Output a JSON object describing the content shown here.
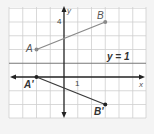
{
  "diagram": {
    "type": "coordinate-reflection",
    "axes": {
      "x_label": "x",
      "y_label": "y",
      "x_tick_label": "1",
      "y_tick_label": "4"
    },
    "line_of_reflection": {
      "label": "y = 1",
      "equation": "y=1"
    },
    "points": {
      "A": {
        "label": "A",
        "x": -2,
        "y": 2
      },
      "B": {
        "label": "B",
        "x": 3,
        "y": 4
      },
      "A_prime": {
        "label": "A'",
        "x": -2,
        "y": 0
      },
      "B_prime": {
        "label": "B'",
        "x": 3,
        "y": -2
      }
    },
    "colors": {
      "grid": "#c8c8c8",
      "original_segment": "#8a8a8a",
      "image_segment": "#3a3a3a",
      "axes": "#222222",
      "reflection_line": "#777777"
    }
  }
}
